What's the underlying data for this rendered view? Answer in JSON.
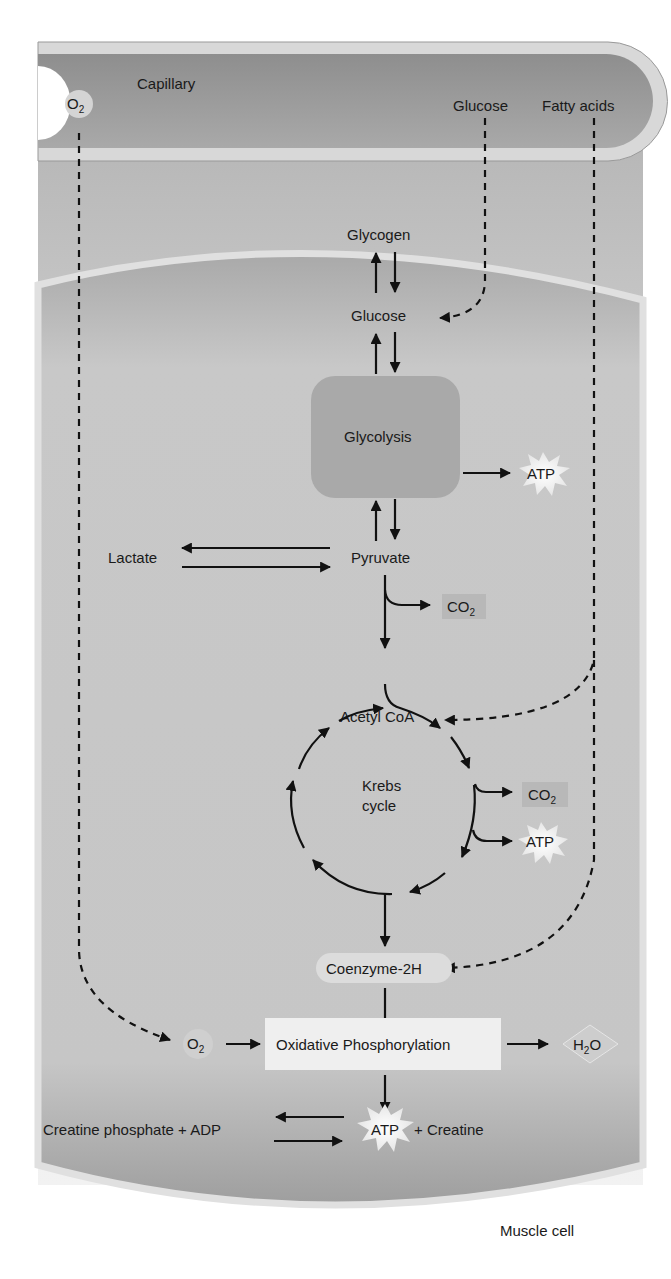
{
  "capillary": {
    "label": "Capillary",
    "o2": {
      "main": "O",
      "sub": "2"
    },
    "glucose": "Glucose",
    "fatty_acids": "Fatty acids"
  },
  "cell": {
    "label": "Muscle cell",
    "glycogen": "Glycogen",
    "glucose": "Glucose",
    "glycolysis": "Glycolysis",
    "atp_glycolysis": "ATP",
    "pyruvate": "Pyruvate",
    "lactate": "Lactate",
    "co2_pyruvate": {
      "main": "CO",
      "sub": "2"
    },
    "acetyl_coa": "Acetyl CoA",
    "krebs_line1": "Krebs",
    "krebs_line2": "cycle",
    "co2_krebs": {
      "main": "CO",
      "sub": "2"
    },
    "atp_krebs": "ATP",
    "coenzyme": "Coenzyme-2H",
    "o2": {
      "main": "O",
      "sub": "2"
    },
    "oxphos": "Oxidative Phosphorylation",
    "h2o": {
      "h": "H",
      "sub": "2",
      "o": "O"
    },
    "atp_final": "ATP",
    "creatine": "+ Creatine",
    "creatine_phosphate": "Creatine phosphate + ADP"
  },
  "colors": {
    "capillary_fill": "#9a9a9a",
    "capillary_wall": "#d6d6d6",
    "cell_fill": "#c4c4c4",
    "glycolysis_box": "#a8a8a8",
    "oxphos_box": "#efefef",
    "co2_box": "#b5b5b5",
    "text": "#1a1a1a"
  }
}
